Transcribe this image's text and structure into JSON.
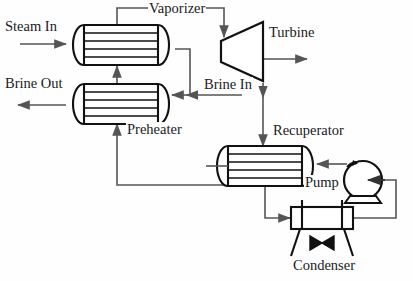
{
  "diagram": {
    "title_visible": false,
    "type": "process-flow-diagram",
    "colors": {
      "equipment_stroke": "#111111",
      "pipe_stroke": "#555555",
      "background": "#fefefe",
      "text": "#1a1a1a"
    },
    "labels": [
      {
        "id": "steam-in",
        "text": "Steam In",
        "x": 4,
        "y": 26
      },
      {
        "id": "vaporizer",
        "text": "Vaporizer",
        "x": 148,
        "y": 8
      },
      {
        "id": "turbine",
        "text": "Turbine",
        "x": 268,
        "y": 32
      },
      {
        "id": "brine-out",
        "text": "Brine Out",
        "x": 4,
        "y": 82
      },
      {
        "id": "brine-in",
        "text": "Brine In",
        "x": 203,
        "y": 78
      },
      {
        "id": "preheater",
        "text": "Preheater",
        "x": 126,
        "y": 123
      },
      {
        "id": "recuperator",
        "text": "Recuperator",
        "x": 272,
        "y": 124
      },
      {
        "id": "pump",
        "text": "Pump",
        "x": 306,
        "y": 180
      },
      {
        "id": "condenser",
        "text": "Condenser",
        "x": 292,
        "y": 262
      }
    ],
    "equipment": [
      {
        "id": "vaporizer",
        "kind": "shell-and-tube-heat-exchanger",
        "tube_lines": 4
      },
      {
        "id": "preheater",
        "kind": "shell-and-tube-heat-exchanger",
        "tube_lines": 4
      },
      {
        "id": "recuperator",
        "kind": "shell-and-tube-heat-exchanger",
        "tube_lines": 4
      },
      {
        "id": "turbine",
        "kind": "turbine-trapezoid"
      },
      {
        "id": "pump",
        "kind": "centrifugal-pump-circle"
      },
      {
        "id": "condenser",
        "kind": "air-cooled-condenser-with-fan"
      }
    ],
    "streams": [
      {
        "id": "steam-in-to-vaporizer",
        "from": "steam-in",
        "to": "vaporizer"
      },
      {
        "id": "vaporizer-to-turbine",
        "from": "vaporizer",
        "to": "turbine"
      },
      {
        "id": "turbine-work-out",
        "from": "turbine",
        "to": "work-out"
      },
      {
        "id": "turbine-to-recuperator",
        "from": "turbine",
        "to": "recuperator"
      },
      {
        "id": "brine-in-to-preheater",
        "from": "brine-in",
        "to": "preheater"
      },
      {
        "id": "preheater-to-brine-out",
        "from": "preheater",
        "to": "brine-out"
      },
      {
        "id": "preheater-to-vaporizer",
        "from": "preheater",
        "to": "vaporizer"
      },
      {
        "id": "vaporizer-shell-to-brine-line",
        "from": "vaporizer",
        "to": "brine-line"
      },
      {
        "id": "recuperator-to-preheater",
        "from": "recuperator",
        "to": "preheater"
      },
      {
        "id": "recuperator-to-condenser",
        "from": "recuperator",
        "to": "condenser"
      },
      {
        "id": "condenser-to-pump",
        "from": "condenser",
        "to": "pump"
      },
      {
        "id": "pump-to-recuperator",
        "from": "pump",
        "to": "recuperator"
      }
    ]
  }
}
